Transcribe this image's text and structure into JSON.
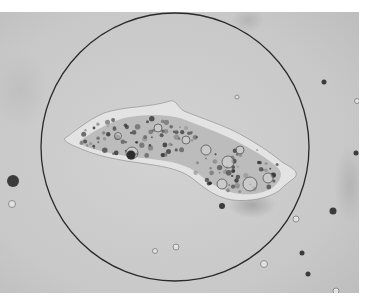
{
  "image": {
    "kind": "light-microscope photograph",
    "colormode": "grayscale",
    "width": 376,
    "height": 302,
    "colors": {
      "page_margin": "#ffffff",
      "field_gray": "#c9c9c9",
      "field_gray_light": "#d3d3d3",
      "circle_line": "#2a2a2a",
      "cell_rim": "#e4e4e4",
      "cell_body": "#bdbdbd",
      "granule_dark": "#3a3a3a",
      "vacuole": "#d6d6d6"
    }
  },
  "field": {
    "x": 0,
    "y": 12,
    "width": 359,
    "height": 281
  },
  "circle": {
    "cx": 175,
    "cy": 147,
    "r": 134
  },
  "specimen": {
    "label": "amoeba-like cell with granular cytoplasm and pseudopod",
    "bbox": {
      "x": 62,
      "y": 100,
      "width": 236,
      "height": 104
    }
  },
  "debris": [
    {
      "x": 13,
      "y": 181,
      "r": 6,
      "shade": "dark"
    },
    {
      "x": 12,
      "y": 204,
      "r": 3.5,
      "shade": "light"
    },
    {
      "x": 324,
      "y": 82,
      "r": 2.5,
      "shade": "dark"
    },
    {
      "x": 357,
      "y": 101,
      "r": 2.5,
      "shade": "light"
    },
    {
      "x": 356,
      "y": 153,
      "r": 2.5,
      "shade": "dark"
    },
    {
      "x": 333,
      "y": 211,
      "r": 3.5,
      "shade": "dark"
    },
    {
      "x": 302,
      "y": 253,
      "r": 2.5,
      "shade": "dark"
    },
    {
      "x": 264,
      "y": 264,
      "r": 3.5,
      "shade": "light"
    },
    {
      "x": 308,
      "y": 274,
      "r": 2.5,
      "shade": "dark"
    },
    {
      "x": 336,
      "y": 291,
      "r": 3,
      "shade": "light"
    },
    {
      "x": 155,
      "y": 251,
      "r": 2.5,
      "shade": "light"
    },
    {
      "x": 176,
      "y": 247,
      "r": 3,
      "shade": "light"
    },
    {
      "x": 237,
      "y": 97,
      "r": 2,
      "shade": "light"
    },
    {
      "x": 222,
      "y": 206,
      "r": 3,
      "shade": "dark"
    },
    {
      "x": 296,
      "y": 219,
      "r": 3,
      "shade": "light"
    }
  ]
}
